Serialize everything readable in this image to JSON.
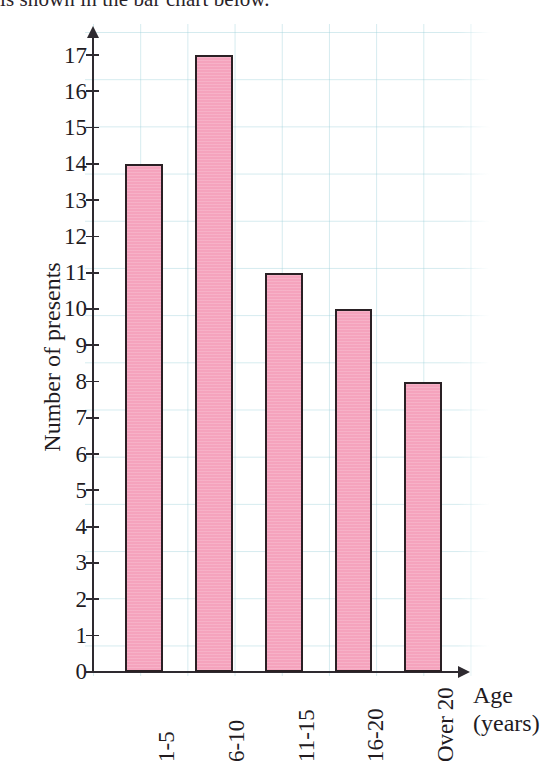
{
  "page": {
    "cut_off_heading": "is shown in the bar chart below."
  },
  "chart_data": {
    "type": "bar",
    "title": "",
    "subtitle": "",
    "categories": [
      "1-5",
      "6-10",
      "11-15",
      "16-20",
      "Over 20"
    ],
    "values": [
      14,
      17,
      11,
      10,
      8
    ],
    "series": [
      {
        "name": "Number of presents",
        "values": [
          14,
          17,
          11,
          10,
          8
        ]
      }
    ],
    "xlabel": "Age",
    "xlabel_unit": "(years)",
    "ylabel": "Number of presents",
    "ylim": [
      0,
      17
    ],
    "ytick_step": 1,
    "yticks": [
      "17",
      "16",
      "15",
      "14",
      "13",
      "12",
      "11",
      "10",
      "9",
      "8",
      "7",
      "6",
      "5",
      "4",
      "3",
      "2",
      "1",
      "0"
    ],
    "grid": true,
    "grid_style": "graph-paper",
    "legend": "none",
    "bar_fill_color": "#f5a3bd",
    "bar_border_color": "#2a2024",
    "axis_color": "#2e2a30",
    "grid_color": "#96cdd7",
    "background_color": "#ffffff",
    "x_tick_rotation": "-90"
  }
}
